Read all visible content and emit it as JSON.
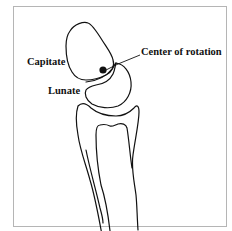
{
  "figure": {
    "labels": {
      "capitate": "Capitate",
      "lunate": "Lunate",
      "center_of_rotation": "Center of rotation"
    },
    "structures": [
      "capitate",
      "lunate",
      "radius"
    ],
    "marker": "center-of-rotation-dot",
    "colors": {
      "line": "#111111",
      "frame": "#b5b5b5",
      "background": "#ffffff"
    }
  }
}
